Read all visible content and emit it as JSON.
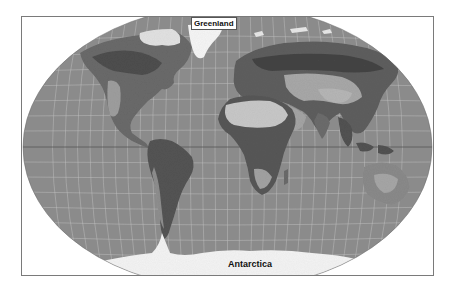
{
  "map": {
    "projection": "Winkel tripel / Hammer-like elliptical world projection",
    "style": "grayscale shaded-relief land with ocean fill and graticule",
    "colors": {
      "ocean": "#8b8b8b",
      "graticule": "#c8c8c8",
      "equator": "#5a5a5a",
      "ice": "#f4f4f4",
      "desert": "#cfcfcf",
      "forest": "#4a4a4a",
      "land": "#727272",
      "frame": "#7a7a7a",
      "background": "#ffffff"
    },
    "labels": {
      "greenland": "Greenland",
      "antarctica": "Antarctica"
    }
  }
}
